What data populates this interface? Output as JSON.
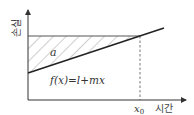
{
  "diagram": {
    "y_axis_label": "손실",
    "x_axis_label": "시간",
    "region_label": "a",
    "function_label": "f(x)=l+mx",
    "x_marker_label": "x",
    "x_marker_subscript": "0",
    "hatch_color": "#888888",
    "line_color": "#222222"
  }
}
